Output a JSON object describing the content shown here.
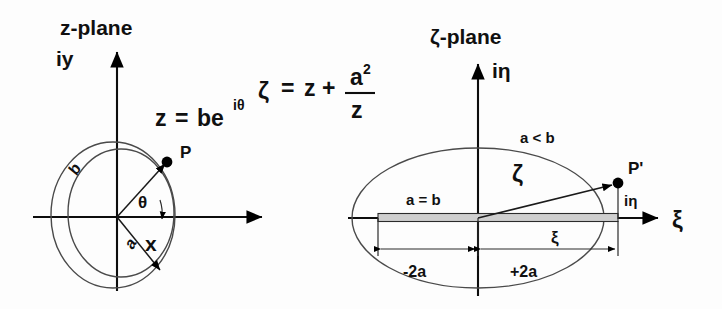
{
  "figure": {
    "title_left": "z-plane",
    "title_right": "ζ-plane",
    "transform_equation": {
      "lhs": "ζ",
      "eq": "=",
      "term1": "z",
      "plus": "+",
      "numerator": "a",
      "numerator_exponent": "2",
      "denominator": "z"
    },
    "point_equation": {
      "lhs": "z",
      "eq": "=",
      "rhs_base": "be",
      "rhs_exponent": "iθ"
    }
  },
  "left_plane": {
    "axis_vertical_label": "iy",
    "axis_horizontal_label": "x",
    "point_label": "P",
    "radius_outer_label": "b",
    "radius_inner_label": "a",
    "angle_label": "θ"
  },
  "right_plane": {
    "axis_vertical_label": "iη",
    "axis_horizontal_label": "ξ",
    "point_label": "P'",
    "vector_label": "ζ",
    "condition_ellipse": "a < b",
    "condition_plate": "a = b",
    "component_imag_label": "iη",
    "component_real_label": "ξ",
    "dim_left_label": "-2a",
    "dim_right_label": "+2a"
  },
  "colors": {
    "ink": "#101010",
    "curve": "#4a4a4a",
    "slit_fill": "#cfcfcf",
    "background": "#ffffff"
  }
}
